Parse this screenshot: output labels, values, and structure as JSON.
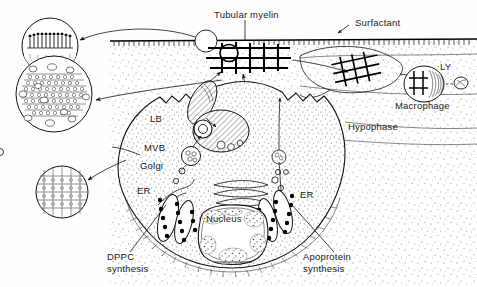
{
  "figure": {
    "title_internal": "Pulmonary surfactant secretion and recycling in the alveolus",
    "background_color": "#fefefe",
    "ink_color": "#111111",
    "width": 477,
    "height": 287
  },
  "labels": {
    "tubular_myelin": "Tubular myelin",
    "surfactant": "Surfactant",
    "ly": "LY",
    "macrophage": "Macrophage",
    "hypophase": "Hypophase",
    "lb": "LB",
    "mvb": "MVB",
    "golgi": "Golgi",
    "er_left": "ER",
    "er_right": "ER",
    "nucleus": "Nucleus",
    "dppc_synthesis_line1": "DPPC",
    "dppc_synthesis_line2": "synthesis",
    "apoprotein_synthesis_line1": "Apoprotein",
    "apoprotein_synthesis_line2": "synthesis"
  },
  "insets": [
    {
      "name": "surfactant-monolayer-inset",
      "depicts": "phospholipid monolayer at air-liquid interface",
      "cx": 50,
      "cy": 46,
      "r": 28
    },
    {
      "name": "lamellar-body-inset",
      "depicts": "lamellar body concentric bilayers with apoprotein",
      "cx": 54,
      "cy": 94,
      "r": 38
    },
    {
      "name": "tubular-myelin-inset",
      "depicts": "tubular myelin lattice bilayer cross-section",
      "cx": 62,
      "cy": 192,
      "r": 26
    }
  ],
  "structures": [
    {
      "name": "air-liquid-interface",
      "label_ref": "surfactant"
    },
    {
      "name": "tubular-myelin-lattice",
      "label_ref": "tubular_myelin"
    },
    {
      "name": "alveolar-type-ii-cell",
      "label_ref": null
    },
    {
      "name": "lamellar-body",
      "label_ref": "lb"
    },
    {
      "name": "multivesicular-body",
      "label_ref": "mvb"
    },
    {
      "name": "golgi-apparatus",
      "label_ref": "golgi"
    },
    {
      "name": "endoplasmic-reticulum-left",
      "label_ref": "er_left"
    },
    {
      "name": "endoplasmic-reticulum-right",
      "label_ref": "er_right"
    },
    {
      "name": "nucleus",
      "label_ref": "nucleus"
    },
    {
      "name": "macrophage",
      "label_ref": "macrophage"
    },
    {
      "name": "lysosome",
      "label_ref": "ly"
    },
    {
      "name": "hypophase-region",
      "label_ref": "hypophase"
    }
  ]
}
